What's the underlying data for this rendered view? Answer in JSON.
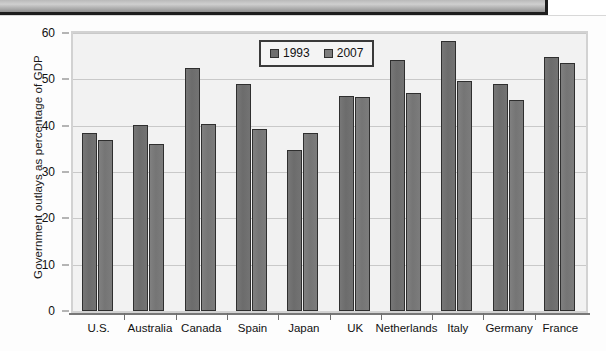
{
  "banner": {
    "label": "decorative-header-strip"
  },
  "chart_data": {
    "type": "bar",
    "title": "",
    "xlabel": "",
    "ylabel": "Government outlays as percentage of GDP",
    "ylim": [
      0,
      60
    ],
    "yticks": [
      0,
      10,
      20,
      30,
      40,
      50,
      60
    ],
    "ytick_labels": [
      "0",
      "10",
      "20",
      "30",
      "40",
      "50",
      "60"
    ],
    "grid": true,
    "legend_position": "top-center",
    "categories": [
      "U.S.",
      "Australia",
      "Canada",
      "Spain",
      "Japan",
      "UK",
      "Netherlands",
      "Italy",
      "Germany",
      "France"
    ],
    "series": [
      {
        "name": "1993",
        "color": "#6e6e6e",
        "values": [
          38.4,
          40.2,
          52.5,
          48.9,
          34.7,
          46.5,
          54.2,
          58.3,
          48.9,
          54.8
        ]
      },
      {
        "name": "2007",
        "color": "#7d7d7d",
        "values": [
          36.9,
          36.0,
          40.3,
          39.2,
          38.4,
          46.2,
          47.1,
          49.7,
          45.6,
          53.5
        ]
      }
    ]
  }
}
